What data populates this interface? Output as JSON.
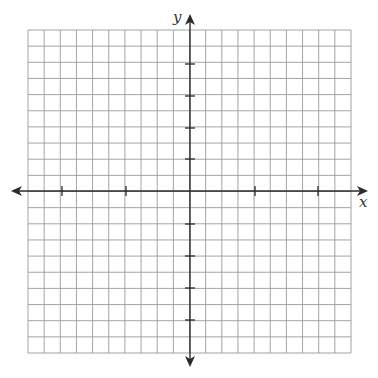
{
  "diagram": {
    "type": "coordinate-plane",
    "grid": {
      "cells_x": 20,
      "cells_y": 20,
      "left": 28,
      "top": 30,
      "right": 351,
      "bottom": 353,
      "line_color": "#9a9a9a"
    },
    "axes": {
      "color": "#2b2b2b",
      "origin_px": [
        190,
        191
      ],
      "x_label": "x",
      "y_label": "y",
      "x_ticks_px": [
        62,
        126,
        255,
        318
      ],
      "y_ticks_px": [
        64,
        96,
        128,
        159,
        224,
        256,
        288,
        320
      ]
    }
  }
}
